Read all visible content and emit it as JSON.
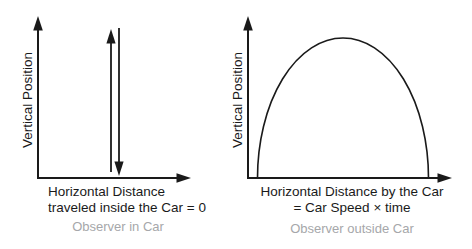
{
  "figure": {
    "description_visible": false
  },
  "left_diagram": {
    "y_axis_label": "Vertical Position",
    "x_axis_label_line1": "Horizontal Distance",
    "x_axis_label_line2": "traveled inside the Car = 0",
    "caption": "Observer in Car"
  },
  "right_diagram": {
    "y_axis_label": "Vertical Position",
    "x_axis_label_line1": "Horizontal Distance by the Car",
    "x_axis_label_line2": "= Car Speed × time",
    "caption": "Observer outside Car"
  },
  "colors": {
    "line": "#1a1a1a",
    "caption_text": "#a6a7aa",
    "background": "#ffffff"
  }
}
